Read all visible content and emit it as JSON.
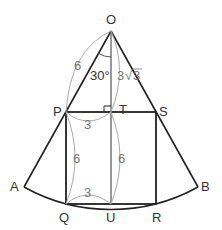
{
  "diagram": {
    "type": "geometry",
    "points": {
      "O": {
        "label": "O",
        "x": 111,
        "y": 31
      },
      "P": {
        "label": "P",
        "x": 66,
        "y": 112
      },
      "T": {
        "label": "T",
        "x": 111,
        "y": 112
      },
      "S": {
        "label": "S",
        "x": 156,
        "y": 112
      },
      "Q": {
        "label": "Q",
        "x": 66,
        "y": 204
      },
      "U": {
        "label": "U",
        "x": 111,
        "y": 204
      },
      "R": {
        "label": "R",
        "x": 156,
        "y": 204
      },
      "A": {
        "label": "A",
        "x": 24,
        "y": 187
      },
      "B": {
        "label": "B",
        "x": 198,
        "y": 187
      }
    },
    "measurements": {
      "OP": "6",
      "OT": "3√3",
      "OT_coef": "3",
      "OT_rad": "3",
      "angle_POT": "30°",
      "PT": "3",
      "PQ": "6",
      "TU": "6",
      "QU": "3"
    },
    "colors": {
      "main_line": "#222222",
      "annotation": "#999999",
      "label": "#333333"
    }
  }
}
